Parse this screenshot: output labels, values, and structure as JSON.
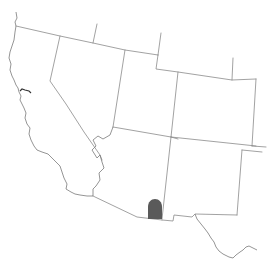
{
  "map": {
    "region": "Southwestern United States",
    "states": [
      "California",
      "Nevada",
      "Utah",
      "Arizona",
      "Colorado",
      "New Mexico"
    ],
    "colors": {
      "background": "#ffffff",
      "border": "#8a8a8a",
      "range_fill": "#5a5a5a"
    },
    "highlighted_range": {
      "label": "distribution-range",
      "location": "southeastern Arizona",
      "fill": "#5a5a5a"
    }
  },
  "paths": {
    "ca_coast": "M16,12 L17,18 L15,22 L16,26 L15,32 L14,40 L12,46 L10,52 L9,58 L11,64 L10,70 L12,76 L14,80 L16,85 L18,88 L19,92 L21,96 L20,100 L22,104 L24,108 L26,113 L25,118 L27,124 L30,128 L29,134 L31,140 L34,146 L37,150 L42,152 L48,154 L52,158 L56,162 L60,166 L62,172 L64,178 L67,184 L66,189 L71,192 L75,194 L80,195 L87,196 L93,196",
    "sf_bay": "M20,91 L22,89 L25,90 L29,91 L31,93",
    "or_north_border": "M16,26 L60,36 L93,43 L125,50 L158,55",
    "id_nv_stub": "M97,24 L93,43",
    "id_ut_stub": "M161,33 L158,55",
    "ut_wy_border": "M158,55 L156,69 L178,72 L232,80 L256,79",
    "wy_co_stub": "M233,58 L232,80",
    "ca_nv_border": "M60,36 L50,81 L66,104 L84,132 L100,155 L102,160",
    "nv_ut_border": "M125,50 L113,127",
    "nv_az_colorado": "M113,127 L110,135 L103,139 L98,136 L93,140 L96,146 L92,150 L97,158 L100,155 L102,162 L104,168 L99,173 L100,180 L96,186 L93,189 L93,196",
    "ut_az_border": "M113,127 L171,137 L178,139",
    "ut_co_border": "M178,72 L171,137",
    "co_nm_border": "M171,137 L256,146",
    "co_east_border": "M256,79 L252,146",
    "co_ks_stub": "M252,146 L266,147",
    "ok_stub": "M242,150 L262,152",
    "az_nm_border": "M171,137 L162,219",
    "nm_east_border": "M242,150 L237,215",
    "az_mexico_border": "M93,196 L137,217 L162,220",
    "nm_mexico_border": "M162,220 L173,221 L174,215 L192,217 L195,214 L237,215",
    "rio_grande": "M195,214 L197,219 L201,224 L205,229 L208,233 L211,238 L214,242 L216,247 L219,251 L223,254 L229,257 L233,258 L236,255 L240,252 L243,250 L246,247 L249,246 L253,248 L257,250"
  },
  "range_shape": {
    "path": "M148,219 L148,207 C148,202 151,199 155,199 C159,199 162,202 162,207 L162,219 Z"
  }
}
